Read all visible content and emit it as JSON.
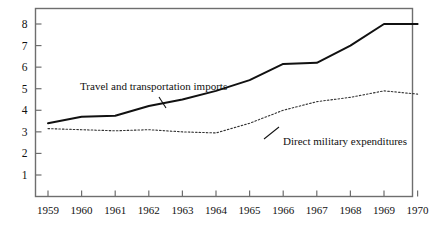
{
  "chart_data": {
    "type": "line",
    "title": "",
    "subtitle": "",
    "xlabel": "",
    "ylabel": "",
    "x": [
      1959,
      1960,
      1961,
      1962,
      1963,
      1964,
      1965,
      1966,
      1967,
      1968,
      1969,
      1970
    ],
    "categories": [
      "1959",
      "1960",
      "1961",
      "1962",
      "1963",
      "1964",
      "1965",
      "1966",
      "1967",
      "1968",
      "1969",
      "1970"
    ],
    "xlim": [
      1959,
      1970
    ],
    "ylim": [
      0,
      8.6
    ],
    "y_ticks": [
      1,
      2,
      3,
      4,
      5,
      6,
      7,
      8
    ],
    "y_tick_labels": [
      "1",
      "2",
      "3",
      "4",
      "5",
      "6",
      "7",
      "8"
    ],
    "grid": false,
    "legend_position": "inline-annotation",
    "series": [
      {
        "name": "Travel and transportation imports",
        "style": "solid",
        "color": "#111111",
        "line_width": 2.0,
        "values": [
          3.4,
          3.7,
          3.75,
          4.2,
          4.5,
          4.9,
          5.4,
          6.15,
          6.2,
          7.0,
          8.0,
          8.0
        ]
      },
      {
        "name": "Direct military expenditures",
        "style": "dotted",
        "color": "#333333",
        "line_width": 1.1,
        "values": [
          3.15,
          3.1,
          3.05,
          3.1,
          3.0,
          2.95,
          3.4,
          4.0,
          4.4,
          4.6,
          4.9,
          4.75
        ]
      }
    ],
    "annotations": [
      {
        "text": "Travel and transportation imports",
        "target_series": "Travel and transportation imports",
        "position": "upper-left"
      },
      {
        "text": "Direct military expenditures",
        "target_series": "Direct military expenditures",
        "position": "lower-right"
      }
    ]
  },
  "axes": {
    "y_labels": [
      "8",
      "7",
      "6",
      "5",
      "4",
      "3",
      "2",
      "1"
    ],
    "x_labels": [
      "1959",
      "1960",
      "1961",
      "1962",
      "1963",
      "1964",
      "1965",
      "1966",
      "1967",
      "1968",
      "1969",
      "1970"
    ]
  },
  "annotations": {
    "imports_label": "Travel and transportation imports",
    "military_label": "Direct military expenditures"
  },
  "colors": {
    "background": "#ffffff",
    "frame": "#6b6b6b",
    "ink": "#111111",
    "dotted": "#3a3a3a"
  }
}
